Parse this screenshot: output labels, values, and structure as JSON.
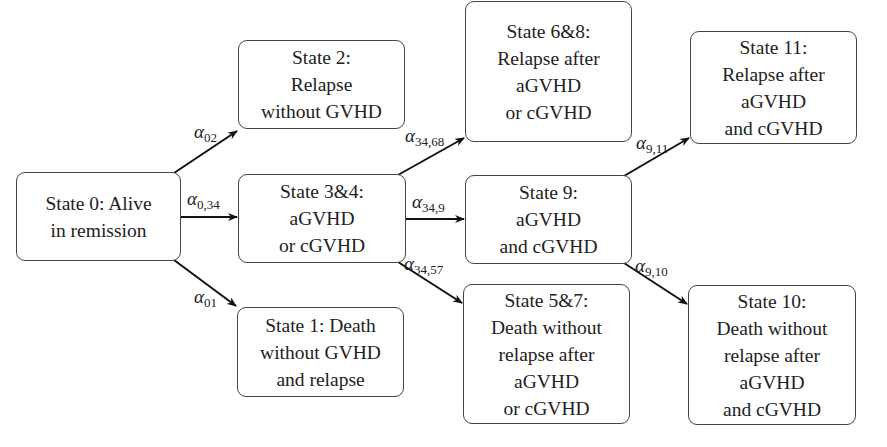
{
  "diagram": {
    "type": "multi-state model",
    "states": [
      {
        "id": "s0",
        "lines": [
          "State 0: Alive",
          "in remission"
        ]
      },
      {
        "id": "s1",
        "lines": [
          "State 1: Death",
          "without GVHD",
          "and relapse"
        ]
      },
      {
        "id": "s2",
        "lines": [
          "State 2:",
          "Relapse",
          "without GVHD"
        ]
      },
      {
        "id": "s34",
        "lines": [
          "State 3&4:",
          "aGVHD",
          "or cGVHD"
        ]
      },
      {
        "id": "s68",
        "lines": [
          "State 6&8:",
          "Relapse after",
          "aGVHD",
          "or cGVHD"
        ]
      },
      {
        "id": "s9",
        "lines": [
          "State 9:",
          "aGVHD",
          "and cGVHD"
        ]
      },
      {
        "id": "s57",
        "lines": [
          "State 5&7:",
          "Death without",
          "relapse after",
          "aGVHD",
          "or cGVHD"
        ]
      },
      {
        "id": "s11",
        "lines": [
          "State 11:",
          "Relapse after",
          "aGVHD",
          "and cGVHD"
        ]
      },
      {
        "id": "s10",
        "lines": [
          "State 10:",
          "Death without",
          "relapse after",
          "aGVHD",
          "and cGVHD"
        ]
      }
    ],
    "transitions": [
      {
        "from": "s0",
        "to": "s2",
        "symbol": "α",
        "sub": "02"
      },
      {
        "from": "s0",
        "to": "s34",
        "symbol": "α",
        "sub": "0,34"
      },
      {
        "from": "s0",
        "to": "s1",
        "symbol": "α",
        "sub": "01"
      },
      {
        "from": "s34",
        "to": "s68",
        "symbol": "α",
        "sub": "34,68"
      },
      {
        "from": "s34",
        "to": "s9",
        "symbol": "α",
        "sub": "34,9"
      },
      {
        "from": "s34",
        "to": "s57",
        "symbol": "α",
        "sub": "34,57"
      },
      {
        "from": "s9",
        "to": "s11",
        "symbol": "α",
        "sub": "9,11"
      },
      {
        "from": "s9",
        "to": "s10",
        "symbol": "α",
        "sub": "9,10"
      }
    ]
  }
}
